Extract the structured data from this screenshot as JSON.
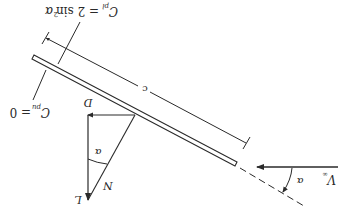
{
  "figure": {
    "orientation": "rotated-180",
    "colors": {
      "line": "#2a2a2a",
      "background": "#ffffff"
    }
  },
  "labels": {
    "cp_upper": "C",
    "cp_upper_sub": "pu",
    "cp_upper_eq": "= 0",
    "cp_lower": "C",
    "cp_lower_sub": "pl",
    "cp_lower_eq": "= 2 sin",
    "cp_lower_exp": "2",
    "cp_lower_alpha": "α",
    "chord": "c",
    "drag": "D",
    "lift": "L",
    "normal": "N",
    "alpha_force": "α",
    "alpha_flow": "α",
    "freestream": "V",
    "freestream_sub": "∞"
  }
}
